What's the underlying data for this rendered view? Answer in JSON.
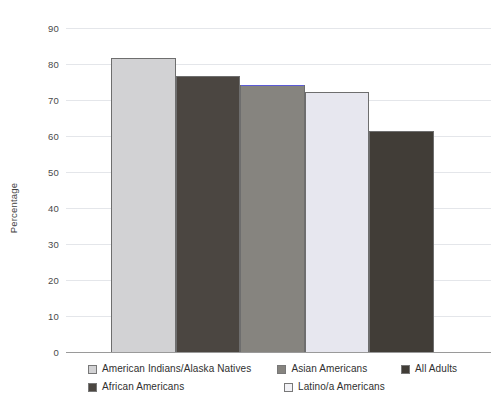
{
  "chart_data": {
    "type": "bar",
    "title": "",
    "xlabel": "",
    "ylabel": "Percentage",
    "ylim": [
      0,
      90
    ],
    "ytick_step": 10,
    "yticks": [
      90,
      80,
      70,
      60,
      50,
      40,
      30,
      20,
      10,
      0
    ],
    "grid": true,
    "legend_position": "bottom",
    "categories": [
      "American Indians/Alaska Natives",
      "African Americans",
      "Asian Americans",
      "Latino/a Americans",
      "All Adults"
    ],
    "values": [
      81.7,
      76.7,
      74.3,
      72.3,
      61.3
    ],
    "bars": [
      {
        "label": "American Indians/Alaska Natives",
        "value": 81.7,
        "color": "#d2d2d4",
        "border": "#6e6e6e",
        "cap_color": ""
      },
      {
        "label": "African Americans",
        "value": 76.7,
        "color": "#4b4641",
        "border": "#6e6e6e",
        "cap_color": ""
      },
      {
        "label": "Asian Americans",
        "value": 74.3,
        "color": "#86847f",
        "border": "#6e6e6e",
        "cap_color": "#5b5bd6"
      },
      {
        "label": "Latino/a Americans",
        "value": 72.3,
        "color": "#e7e7ef",
        "border": "#6e6e6e",
        "cap_color": ""
      },
      {
        "label": "All Adults",
        "value": 61.3,
        "color": "#413d37",
        "border": "#6e6e6e",
        "cap_color": ""
      }
    ]
  },
  "axis": {
    "ylabel": "Percentage",
    "tick_90": "90",
    "tick_80": "80",
    "tick_70": "70",
    "tick_60": "60",
    "tick_50": "50",
    "tick_40": "40",
    "tick_30": "30",
    "tick_20": "20",
    "tick_10": "10",
    "tick_0": "0"
  },
  "legend": {
    "row1": [
      {
        "label": "American Indians/Alaska Natives",
        "color": "#d2d2d4"
      },
      {
        "label": "Asian Americans",
        "color": "#86847f"
      },
      {
        "label": "All Adults",
        "color": "#413d37"
      }
    ],
    "row2": [
      {
        "label": "African Americans",
        "color": "#4b4641"
      },
      {
        "label": "Latino/a Americans",
        "color": "#f2f2f6"
      }
    ]
  },
  "colors": {
    "grid": "#e4e6ea",
    "axis": "#9a9a9a",
    "text": "#2f2f2f",
    "accent_cap": "#5b5bd6"
  }
}
